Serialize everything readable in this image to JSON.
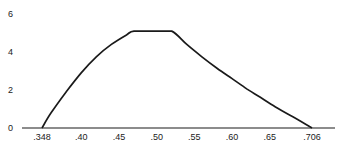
{
  "chart_data": {
    "type": "line",
    "title": "",
    "xlabel": "",
    "ylabel": "",
    "grid": false,
    "legend": null,
    "xlim": [
      0.33,
      0.74
    ],
    "ylim": [
      0,
      6
    ],
    "x_ticks": [
      {
        "value": 0.348,
        "label": ".348"
      },
      {
        "value": 0.4,
        "label": ".40"
      },
      {
        "value": 0.45,
        "label": ".45"
      },
      {
        "value": 0.5,
        "label": ".50"
      },
      {
        "value": 0.55,
        "label": ".55"
      },
      {
        "value": 0.6,
        "label": ".60"
      },
      {
        "value": 0.65,
        "label": ".65"
      },
      {
        "value": 0.706,
        "label": ".706"
      }
    ],
    "y_ticks": [
      {
        "value": 0,
        "label": "0"
      },
      {
        "value": 2,
        "label": "2"
      },
      {
        "value": 4,
        "label": "4"
      },
      {
        "value": 6,
        "label": "6"
      }
    ],
    "series": [
      {
        "name": "curve",
        "x": [
          0.348,
          0.36,
          0.38,
          0.4,
          0.42,
          0.44,
          0.46,
          0.47,
          0.5,
          0.52,
          0.54,
          0.56,
          0.58,
          0.6,
          0.62,
          0.64,
          0.66,
          0.68,
          0.706
        ],
        "y": [
          0,
          0.8,
          1.9,
          2.9,
          3.75,
          4.4,
          4.9,
          5.1,
          5.1,
          5.1,
          4.4,
          3.75,
          3.15,
          2.6,
          2.05,
          1.55,
          1.05,
          0.6,
          0
        ]
      }
    ]
  }
}
